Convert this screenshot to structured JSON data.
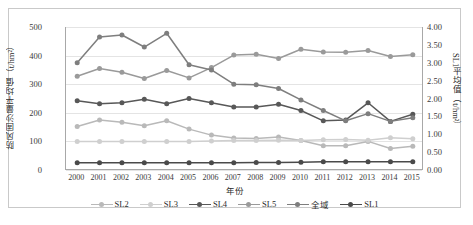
{
  "chart_data": {
    "type": "line",
    "title": "",
    "xlabel": "年份",
    "ylabel": "防风固沙量平均值（t/hm²）",
    "y2label": "SL1平均值（t/hm²）",
    "categories": [
      "2000",
      "2001",
      "2002",
      "2003",
      "2004",
      "2005",
      "2006",
      "2007",
      "2008",
      "2009",
      "2010",
      "2011",
      "2012",
      "2013",
      "2014",
      "2015"
    ],
    "ylim": [
      0,
      500
    ],
    "yticks": [
      "0",
      "100",
      "200",
      "300",
      "400",
      "500"
    ],
    "y2lim": [
      0,
      4.0
    ],
    "y2ticks": [
      "0.00",
      "0.50",
      "1.00",
      "1.50",
      "2.00",
      "2.50",
      "3.00",
      "3.50",
      "4.00"
    ],
    "grid": true,
    "legend_position": "bottom",
    "series": [
      {
        "name": "SL2",
        "axis": "left",
        "color": "#b9b9b9",
        "values": [
          152,
          175,
          167,
          155,
          172,
          143,
          122,
          112,
          110,
          115,
          103,
          85,
          85,
          100,
          75,
          83
        ]
      },
      {
        "name": "SL3",
        "axis": "left",
        "color": "#cfcfcf",
        "values": [
          100,
          100,
          100,
          100,
          100,
          100,
          101,
          103,
          103,
          104,
          103,
          106,
          107,
          104,
          113,
          109
        ]
      },
      {
        "name": "SL4",
        "axis": "left",
        "color": "#585858",
        "values": [
          242,
          232,
          235,
          247,
          232,
          250,
          235,
          220,
          220,
          230,
          208,
          172,
          175,
          235,
          170,
          195
        ]
      },
      {
        "name": "SL5",
        "axis": "left",
        "color": "#9a9a9a",
        "values": [
          328,
          355,
          342,
          320,
          348,
          322,
          358,
          402,
          405,
          390,
          422,
          413,
          412,
          418,
          397,
          403
        ]
      },
      {
        "name": "全域",
        "axis": "left",
        "color": "#7e7e7e",
        "values": [
          375,
          465,
          472,
          430,
          478,
          368,
          350,
          300,
          298,
          285,
          245,
          208,
          172,
          197,
          170,
          183
        ]
      },
      {
        "name": "SL1",
        "axis": "right",
        "color": "#4a4a4a",
        "values": [
          0.2,
          0.2,
          0.2,
          0.2,
          0.2,
          0.2,
          0.2,
          0.2,
          0.21,
          0.21,
          0.22,
          0.23,
          0.23,
          0.23,
          0.23,
          0.23
        ]
      }
    ]
  },
  "axes": {
    "left_title": "防风固沙量平均值（t/hm²）",
    "right_title": "SL1平均值（t/hm²）",
    "x_title": "年份"
  },
  "legend": {
    "items": [
      {
        "label": "SL2",
        "color": "#b9b9b9"
      },
      {
        "label": "SL3",
        "color": "#cfcfcf"
      },
      {
        "label": "SL4",
        "color": "#585858"
      },
      {
        "label": "SL5",
        "color": "#9a9a9a"
      },
      {
        "label": "全域",
        "color": "#7e7e7e"
      },
      {
        "label": "SL1",
        "color": "#4a4a4a"
      }
    ]
  }
}
